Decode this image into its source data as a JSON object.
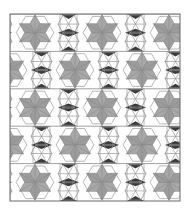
{
  "pattern": {
    "description": "Six-pointed star and hexagon tessellation quilt pattern",
    "frame": {
      "x": 10,
      "y": 14,
      "width": 170,
      "height": 187
    },
    "rows": 5,
    "row_height": 37.4,
    "star_cell_width": 50,
    "narrow_cell_width": 17,
    "colors": {
      "background": "#ffffff",
      "star_fill": "#9c9c9c",
      "star_fill_alt": "#a8a8a8",
      "dark_triangle": "#3a3a3a",
      "line": "#8a8a8a",
      "frame": "#6a6a6a"
    }
  }
}
